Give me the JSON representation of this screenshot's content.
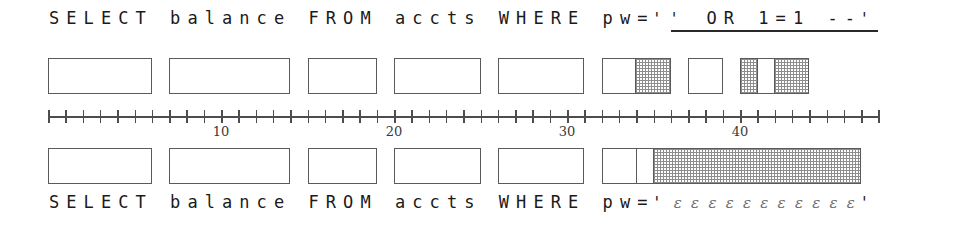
{
  "figure": {
    "type": "sql-injection-alignment-diagram",
    "width": 975,
    "height": 225,
    "ink_color": "#4d4d4d",
    "hatch_color": "#8d8d8d",
    "background": "#ffffff"
  },
  "top_query": {
    "full_text": "SELECT balance FROM accts WHERE pw='' OR 1=1 --'",
    "segments": [
      {
        "text": "SELECT  balance  FROM  accts  WHERE  pw=",
        "underlined": false
      },
      {
        "text": "'",
        "underlined": false
      },
      {
        "text": "'  OR  1=1  --'",
        "underlined": true
      }
    ]
  },
  "bottom_query": {
    "full_text": "SELECT balance FROM accts WHERE pw='εεεεεεεεεεε'",
    "prefix": "SELECT  balance  FROM  accts  WHERE  pw=",
    "open_quote": "'",
    "epsilon_char": "ε",
    "epsilon_count": 11,
    "epsilons": "ε ε ε ε ε ε ε ε ε ε ε",
    "close_quote": "'"
  },
  "ruler": {
    "min": 0,
    "max": 48,
    "tick_interval": 1,
    "label_interval": 10,
    "labels": [
      {
        "value": 10,
        "text": "10"
      },
      {
        "value": 20,
        "text": "20"
      },
      {
        "value": 30,
        "text": "30"
      },
      {
        "value": 40,
        "text": "40"
      }
    ]
  },
  "top_tokens": [
    {
      "name": "token-select",
      "start": 0,
      "length": 6,
      "cells": [
        {
          "length": 6,
          "shaded": false
        }
      ]
    },
    {
      "name": "token-balance",
      "start": 7,
      "length": 7,
      "cells": [
        {
          "length": 7,
          "shaded": false
        }
      ]
    },
    {
      "name": "token-from",
      "start": 15,
      "length": 4,
      "cells": [
        {
          "length": 4,
          "shaded": false
        }
      ]
    },
    {
      "name": "token-accts",
      "start": 20,
      "length": 5,
      "cells": [
        {
          "length": 5,
          "shaded": false
        }
      ]
    },
    {
      "name": "token-where",
      "start": 26,
      "length": 5,
      "cells": [
        {
          "length": 5,
          "shaded": false
        }
      ]
    },
    {
      "name": "token-pw-eq-quote",
      "start": 32,
      "length": 4,
      "cells": [
        {
          "length": 2,
          "shaded": false
        },
        {
          "length": 2,
          "shaded": true
        }
      ]
    },
    {
      "name": "token-or",
      "start": 37,
      "length": 2,
      "cells": [
        {
          "length": 2,
          "shaded": false
        }
      ]
    },
    {
      "name": "token-one-eq-one-comment",
      "start": 40,
      "length": 4,
      "cells": [
        {
          "length": 1,
          "shaded": true
        },
        {
          "length": 1,
          "shaded": false
        },
        {
          "length": 2,
          "shaded": true
        }
      ]
    }
  ],
  "bottom_tokens": [
    {
      "name": "token-select",
      "start": 0,
      "length": 6,
      "cells": [
        {
          "length": 6,
          "shaded": false
        }
      ]
    },
    {
      "name": "token-balance",
      "start": 7,
      "length": 7,
      "cells": [
        {
          "length": 7,
          "shaded": false
        }
      ]
    },
    {
      "name": "token-from",
      "start": 15,
      "length": 4,
      "cells": [
        {
          "length": 4,
          "shaded": false
        }
      ]
    },
    {
      "name": "token-accts",
      "start": 20,
      "length": 5,
      "cells": [
        {
          "length": 5,
          "shaded": false
        }
      ]
    },
    {
      "name": "token-where",
      "start": 26,
      "length": 5,
      "cells": [
        {
          "length": 5,
          "shaded": false
        }
      ]
    },
    {
      "name": "token-pw-eq-literal",
      "start": 32,
      "length": 15,
      "cells": [
        {
          "length": 2,
          "shaded": false
        },
        {
          "length": 1,
          "shaded": false
        },
        {
          "length": 12,
          "shaded": true
        }
      ]
    }
  ]
}
